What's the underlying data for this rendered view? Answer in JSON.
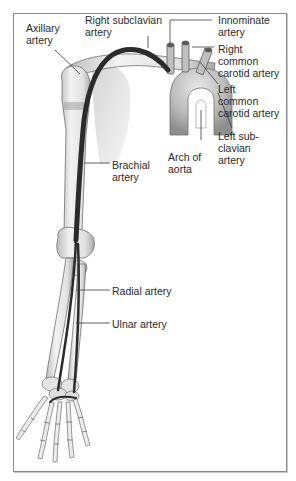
{
  "figure": {
    "type": "anatomical-diagram",
    "colors": {
      "bone_fill": "#e6e6e6",
      "bone_stroke": "#6e6e6e",
      "artery": "#2b2b2b",
      "aorta_fill": "#bdbdbd",
      "shoulder_shadow": "#d9d9d9",
      "leader_line": "#3a3a3a",
      "frame_border": "#8a8a8a"
    }
  },
  "labels": {
    "axillary_artery": "Axillary\nartery",
    "right_subclavian_artery": "Right subclavian\nartery",
    "innominate_artery": "Innominate\nartery",
    "right_common_carotid_artery": "Right\ncommon\ncarotid artery",
    "left_common_carotid_artery": "Left\ncommon\ncarotid artery",
    "left_subclavian_artery": "Left sub-\nclavian\nartery",
    "arch_of_aorta": "Arch of\naorta",
    "brachial_artery": "Brachial\nartery",
    "radial_artery": "Radial artery",
    "ulnar_artery": "Ulnar artery"
  }
}
